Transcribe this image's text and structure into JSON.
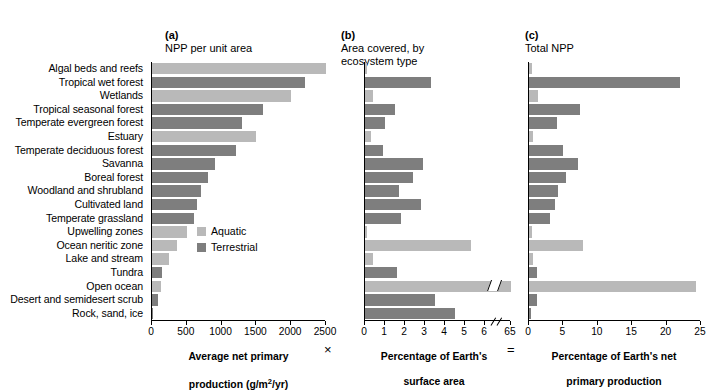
{
  "figure": {
    "legend": {
      "items": [
        {
          "label": "Aquatic",
          "color": "#b9b9b9",
          "key": "aquatic"
        },
        {
          "label": "Terrestrial",
          "color": "#7e7e7e",
          "key": "terrestrial"
        }
      ]
    },
    "operators": {
      "multiply": "×",
      "equals": "="
    }
  },
  "chart_data": [
    {
      "type": "bar",
      "orientation": "horizontal",
      "panel": "a",
      "title": "(a) NPP per unit area",
      "title_prefix": "(a)",
      "title_text": "NPP per unit area",
      "xlabel": "Average net primary production (g/m²/yr)",
      "xlabel_line1": "Average net primary",
      "xlabel_line2": "production (g/m",
      "xlabel_line2_sup": "2",
      "xlabel_line2_end": "/yr)",
      "ylabel": "",
      "xlim": [
        0,
        2500
      ],
      "xticks": [
        0,
        500,
        1000,
        1500,
        2000,
        2500
      ],
      "grid": false,
      "categories": [
        "Algal beds and reefs",
        "Tropical wet forest",
        "Wetlands",
        "Tropical seasonal forest",
        "Temperate evergreen forest",
        "Estuary",
        "Temperate deciduous forest",
        "Savanna",
        "Boreal forest",
        "Woodland and shrubland",
        "Cultivated land",
        "Temperate grassland",
        "Upwelling zones",
        "Ocean neritic zone",
        "Lake and stream",
        "Tundra",
        "Open ocean",
        "Desert and semidesert scrub",
        "Rock, sand, ice"
      ],
      "values": [
        2500,
        2200,
        2000,
        1600,
        1300,
        1500,
        1200,
        900,
        800,
        700,
        650,
        600,
        500,
        360,
        250,
        140,
        125,
        90,
        3
      ],
      "types": [
        "aquatic",
        "terrestrial",
        "aquatic",
        "terrestrial",
        "terrestrial",
        "aquatic",
        "terrestrial",
        "terrestrial",
        "terrestrial",
        "terrestrial",
        "terrestrial",
        "terrestrial",
        "aquatic",
        "aquatic",
        "aquatic",
        "terrestrial",
        "aquatic",
        "terrestrial",
        "terrestrial"
      ]
    },
    {
      "type": "bar",
      "orientation": "horizontal",
      "panel": "b",
      "title": "(b) Area covered, by ecosystem type",
      "title_prefix": "(b)",
      "title_text": "Area covered, by\n     ecosystem type",
      "xlabel": "Percentage of Earth's surface area",
      "xlabel_line1": "Percentage of Earth's",
      "xlabel_line2": "surface area",
      "xlim": [
        0,
        6
      ],
      "xticks": [
        0,
        1,
        2,
        3,
        4,
        5,
        6
      ],
      "axis_break_after": 6,
      "axis_break_label": "65",
      "grid": false,
      "categories": [
        "Algal beds and reefs",
        "Tropical wet forest",
        "Wetlands",
        "Tropical seasonal forest",
        "Temperate evergreen forest",
        "Estuary",
        "Temperate deciduous forest",
        "Savanna",
        "Boreal forest",
        "Woodland and shrubland",
        "Cultivated land",
        "Temperate grassland",
        "Upwelling zones",
        "Ocean neritic zone",
        "Lake and stream",
        "Tundra",
        "Open ocean",
        "Desert and semidesert scrub",
        "Rock, sand, ice"
      ],
      "values": [
        0.1,
        3.3,
        0.4,
        1.5,
        1.0,
        0.3,
        0.9,
        2.9,
        2.4,
        1.7,
        2.8,
        1.8,
        0.1,
        5.3,
        0.4,
        1.6,
        65.0,
        3.5,
        4.5
      ],
      "types": [
        "aquatic",
        "terrestrial",
        "aquatic",
        "terrestrial",
        "terrestrial",
        "aquatic",
        "terrestrial",
        "terrestrial",
        "terrestrial",
        "terrestrial",
        "terrestrial",
        "terrestrial",
        "aquatic",
        "aquatic",
        "aquatic",
        "terrestrial",
        "aquatic",
        "terrestrial",
        "terrestrial"
      ]
    },
    {
      "type": "bar",
      "orientation": "horizontal",
      "panel": "c",
      "title": "(c) Total NPP",
      "title_prefix": "(c)",
      "title_text": "Total NPP",
      "xlabel": "Percentage of Earth's net primary production",
      "xlabel_line1": "Percentage of Earth's net",
      "xlabel_line2": "primary production",
      "xlim": [
        0,
        25
      ],
      "xticks": [
        0,
        5,
        10,
        15,
        20,
        25
      ],
      "grid": false,
      "categories": [
        "Algal beds and reefs",
        "Tropical wet forest",
        "Wetlands",
        "Tropical seasonal forest",
        "Temperate evergreen forest",
        "Estuary",
        "Temperate deciduous forest",
        "Savanna",
        "Boreal forest",
        "Woodland and shrubland",
        "Cultivated land",
        "Temperate grassland",
        "Upwelling zones",
        "Ocean neritic zone",
        "Lake and stream",
        "Tundra",
        "Open ocean",
        "Desert and semidesert scrub",
        "Rock, sand, ice"
      ],
      "values": [
        0.5,
        22.0,
        1.3,
        7.4,
        4.1,
        0.6,
        5.0,
        7.1,
        5.4,
        4.2,
        3.8,
        3.1,
        0.4,
        7.9,
        0.6,
        1.2,
        24.3,
        1.1,
        0.3
      ],
      "types": [
        "aquatic",
        "terrestrial",
        "aquatic",
        "terrestrial",
        "terrestrial",
        "aquatic",
        "terrestrial",
        "terrestrial",
        "terrestrial",
        "terrestrial",
        "terrestrial",
        "terrestrial",
        "aquatic",
        "aquatic",
        "aquatic",
        "terrestrial",
        "aquatic",
        "terrestrial",
        "terrestrial"
      ]
    }
  ]
}
